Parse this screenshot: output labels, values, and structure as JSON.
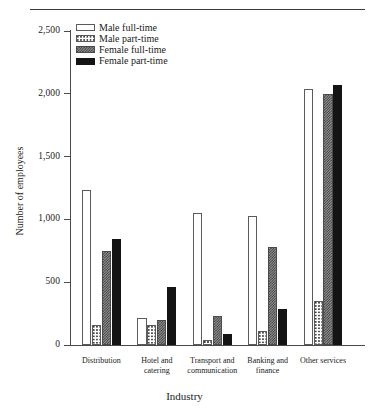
{
  "chart_data": {
    "type": "bar",
    "title": "",
    "xlabel": "Industry",
    "ylabel": "Number of employees",
    "ylim": [
      0,
      2500
    ],
    "yticks": [
      0,
      500,
      1000,
      1500,
      2000,
      2500
    ],
    "ytick_labels": [
      "0",
      "500",
      "1,000",
      "1,500",
      "2,000",
      "2,500"
    ],
    "grid": false,
    "legend_position": "top-left inside axes",
    "categories": [
      "Distribution",
      "Hotel and catering",
      "Transport and communication",
      "Banking and finance",
      "Other services"
    ],
    "category_lines": [
      [
        "Distribution"
      ],
      [
        "Hotel and",
        "catering"
      ],
      [
        "Transport and",
        "communication"
      ],
      [
        "Banking and",
        "finance"
      ],
      [
        "Other services"
      ]
    ],
    "series": [
      {
        "name": "Male full-time",
        "pattern": "white",
        "color": "#ffffff",
        "values": [
          1235,
          215,
          1050,
          1030,
          2040
        ]
      },
      {
        "name": "Male part-time",
        "pattern": "light-dot",
        "color": "#e8e8e8",
        "values": [
          160,
          160,
          40,
          110,
          350
        ]
      },
      {
        "name": "Female full-time",
        "pattern": "checker",
        "color": "#8e8e8e",
        "values": [
          745,
          200,
          230,
          780,
          2000
        ]
      },
      {
        "name": "Female part-time",
        "pattern": "black",
        "color": "#141414",
        "values": [
          845,
          465,
          85,
          290,
          2070
        ]
      }
    ]
  },
  "legend": {
    "items": [
      {
        "label": "Male full-time",
        "swatch": "white"
      },
      {
        "label": "Male part-time",
        "swatch": "light-dot"
      },
      {
        "label": "Female full-time",
        "swatch": "checker"
      },
      {
        "label": "Female part-time",
        "swatch": "black"
      }
    ]
  },
  "axes": {
    "y_title": "Number of employees",
    "x_title": "Industry"
  }
}
